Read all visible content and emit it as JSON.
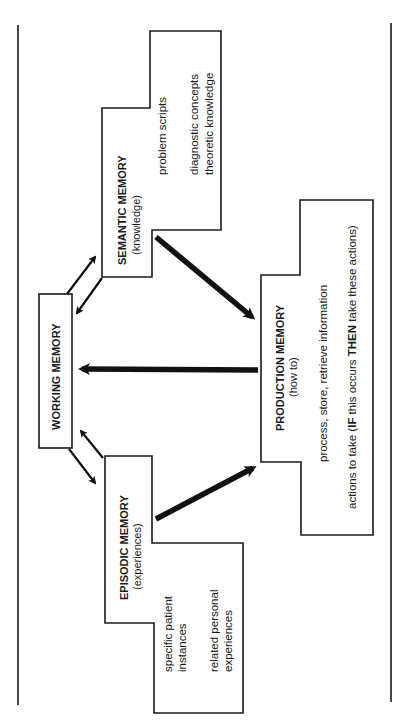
{
  "diagram": {
    "type": "memory-model",
    "orientation": "rotated-90-ccw",
    "nodes": {
      "working": {
        "title": "WORKING MEMORY"
      },
      "semantic": {
        "title": "SEMANTIC MEMORY",
        "subtitle": "(knowledge)",
        "items": [
          "problem scripts",
          "diagnostic concepts",
          "theoretic knowledge"
        ]
      },
      "episodic": {
        "title": "EPISODIC MEMORY",
        "subtitle": "(experiences)",
        "items": [
          "specific patient",
          "instances",
          "related personal",
          "experiences"
        ]
      },
      "production": {
        "title": "PRODUCTION MEMORY",
        "subtitle": "(how to)",
        "items": [
          "process, store, retrieve information"
        ],
        "rule": {
          "prefix": "actions to take (",
          "if": "IF",
          "middle": " this occurs ",
          "then": "THEN",
          "suffix": " take these actions)"
        }
      }
    },
    "edges": [
      {
        "from": "working",
        "to": "semantic",
        "style": "thin"
      },
      {
        "from": "semantic",
        "to": "working",
        "style": "thin"
      },
      {
        "from": "working",
        "to": "episodic",
        "style": "thin"
      },
      {
        "from": "episodic",
        "to": "working",
        "style": "thin"
      },
      {
        "from": "semantic",
        "to": "production",
        "style": "thick"
      },
      {
        "from": "episodic",
        "to": "production",
        "style": "thick"
      },
      {
        "from": "production",
        "to": "working",
        "style": "thick"
      }
    ],
    "colors": {
      "stroke": "#1a1a1a",
      "background": "#ffffff"
    }
  }
}
